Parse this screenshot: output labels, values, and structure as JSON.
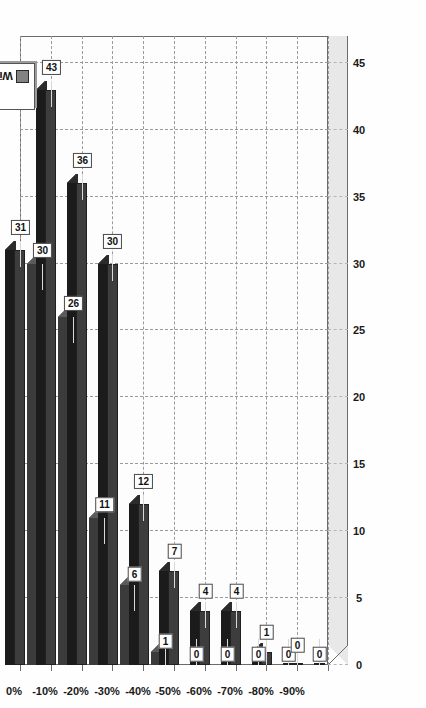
{
  "chart_data": {
    "type": "bar",
    "title": "",
    "subtitle": "",
    "xlabel": "",
    "ylabel": "",
    "orientation": "horizontal-3d",
    "grid": true,
    "legend_position": "top-right",
    "categories": [
      "0%",
      "-10%",
      "-20%",
      "-30%",
      "-40%",
      "-50%",
      "-60%",
      "-70%",
      "-80%",
      "-90%"
    ],
    "value_ticks": [
      "0",
      "5",
      "10",
      "15",
      "20",
      "25",
      "30",
      "35",
      "40",
      "45"
    ],
    "value_tick_values": [
      0,
      5,
      10,
      15,
      20,
      25,
      30,
      35,
      40,
      45
    ],
    "xlim": [
      0,
      47
    ],
    "series": [
      {
        "name": "All Trades",
        "color": "#3d3d3d",
        "values": [
          31,
          43,
          36,
          30,
          12,
          7,
          4,
          4,
          1,
          0
        ],
        "labels": [
          "31",
          "43",
          "36",
          "30",
          "12",
          "7",
          "4",
          "4",
          "1",
          "0"
        ]
      },
      {
        "name": "Winning Trades",
        "color": "#828282",
        "values": [
          30,
          26,
          11,
          6,
          1,
          0,
          0,
          0,
          0,
          0
        ],
        "labels": [
          "30",
          "26",
          "11",
          "6",
          "1",
          "0",
          "0",
          "0",
          "0",
          "0"
        ]
      }
    ]
  },
  "legend": {
    "entries": [
      {
        "label": "All Trades",
        "color": "#3d3d3d"
      },
      {
        "label": "Winning Trades",
        "color": "#828282"
      }
    ]
  },
  "colors": {
    "series_all_trades": "#3d3d3d",
    "series_winning_trades": "#828282",
    "plot_background": "#fdfdfd",
    "floor": "#e8e8e8",
    "gridline": "#9a9a9a",
    "axis": "#6b6b6b",
    "label_border": "#4a4a4a",
    "text": "#1a1a1a"
  }
}
